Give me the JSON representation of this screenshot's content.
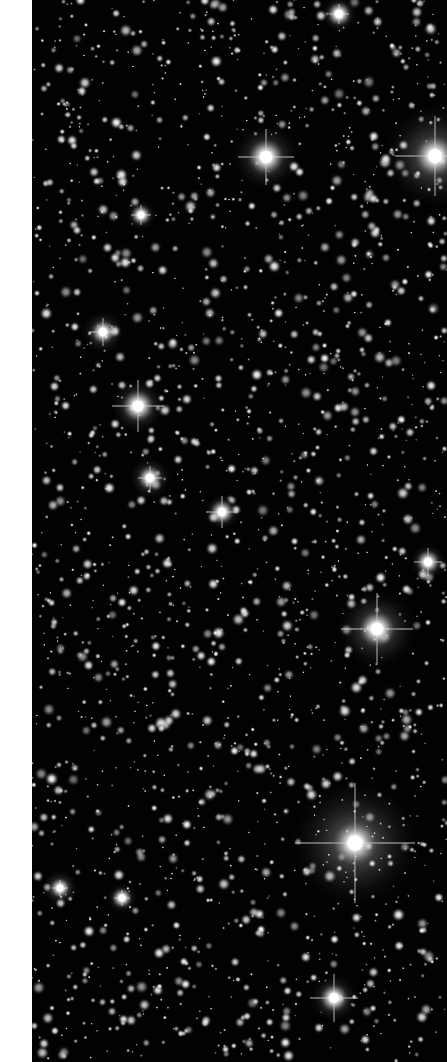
{
  "image": {
    "description": "Dense open star cluster field, grayscale",
    "background_color": "#020202",
    "margin_color": "#ffffff",
    "margin_width": 32,
    "field_width": 415,
    "field_height": 1062
  },
  "bright_stars": [
    {
      "x": 266,
      "y": 157,
      "r": 9,
      "spike": 28,
      "halo": 22
    },
    {
      "x": 435,
      "y": 156,
      "r": 10,
      "spike": 40,
      "halo": 34
    },
    {
      "x": 138,
      "y": 406,
      "r": 8,
      "spike": 26,
      "halo": 18
    },
    {
      "x": 377,
      "y": 629,
      "r": 9,
      "spike": 36,
      "halo": 26
    },
    {
      "x": 355,
      "y": 843,
      "r": 11,
      "spike": 60,
      "halo": 42
    },
    {
      "x": 334,
      "y": 998,
      "r": 7,
      "spike": 24,
      "halo": 16
    },
    {
      "x": 103,
      "y": 332,
      "r": 6,
      "spike": 14,
      "halo": 14
    },
    {
      "x": 222,
      "y": 512,
      "r": 6,
      "spike": 16,
      "halo": 12
    },
    {
      "x": 150,
      "y": 478,
      "r": 6,
      "spike": 12,
      "halo": 14
    },
    {
      "x": 141,
      "y": 215,
      "r": 5,
      "spike": 10,
      "halo": 10
    },
    {
      "x": 428,
      "y": 562,
      "r": 6,
      "spike": 14,
      "halo": 12
    },
    {
      "x": 339,
      "y": 14,
      "r": 6,
      "spike": 10,
      "halo": 12
    },
    {
      "x": 60,
      "y": 888,
      "r": 5,
      "spike": 8,
      "halo": 12
    },
    {
      "x": 122,
      "y": 898,
      "r": 5,
      "spike": 8,
      "halo": 10
    }
  ],
  "starfield": {
    "count": 2200,
    "seed": 7,
    "min_radius": 0.6,
    "max_radius": 3.4
  }
}
